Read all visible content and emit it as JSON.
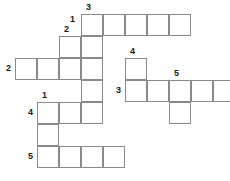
{
  "puzzle": {
    "title": "Crossword Grid",
    "type": "crossword-grid",
    "geometry": {
      "cell_size": 22,
      "origin_x": 15,
      "origin_y": 14,
      "border_color": "#8a8a8a",
      "cell_fill": "#ffffff",
      "background": "#ffffff",
      "number_color": "#1a1a1a"
    },
    "cells": [
      {
        "col": 3,
        "row": 0
      },
      {
        "col": 4,
        "row": 0
      },
      {
        "col": 5,
        "row": 0
      },
      {
        "col": 6,
        "row": 0
      },
      {
        "col": 7,
        "row": 0
      },
      {
        "col": 2,
        "row": 1
      },
      {
        "col": 3,
        "row": 1
      },
      {
        "col": 0,
        "row": 2
      },
      {
        "col": 1,
        "row": 2
      },
      {
        "col": 2,
        "row": 2
      },
      {
        "col": 3,
        "row": 2
      },
      {
        "col": 5,
        "row": 2
      },
      {
        "col": 3,
        "row": 3
      },
      {
        "col": 5,
        "row": 3
      },
      {
        "col": 6,
        "row": 3
      },
      {
        "col": 7,
        "row": 3
      },
      {
        "col": 8,
        "row": 3
      },
      {
        "col": 9,
        "row": 3
      },
      {
        "col": 1,
        "row": 4
      },
      {
        "col": 2,
        "row": 4
      },
      {
        "col": 3,
        "row": 4
      },
      {
        "col": 7,
        "row": 4
      },
      {
        "col": 1,
        "row": 5
      },
      {
        "col": 1,
        "row": 6
      },
      {
        "col": 2,
        "row": 6
      },
      {
        "col": 3,
        "row": 6
      },
      {
        "col": 4,
        "row": 6
      }
    ],
    "numbers": [
      {
        "label": "3",
        "col": 3,
        "row": 0,
        "pos": "above"
      },
      {
        "label": "1",
        "col": 3,
        "row": 0,
        "pos": "left-low"
      },
      {
        "label": "2",
        "col": 2,
        "row": 1,
        "pos": "above"
      },
      {
        "label": "2",
        "col": 0,
        "row": 2,
        "pos": "left"
      },
      {
        "label": "4",
        "col": 5,
        "row": 2,
        "pos": "above"
      },
      {
        "label": "3",
        "col": 5,
        "row": 3,
        "pos": "left"
      },
      {
        "label": "5",
        "col": 7,
        "row": 3,
        "pos": "above"
      },
      {
        "label": "1",
        "col": 1,
        "row": 4,
        "pos": "above"
      },
      {
        "label": "4",
        "col": 1,
        "row": 4,
        "pos": "left"
      },
      {
        "label": "5",
        "col": 1,
        "row": 6,
        "pos": "left"
      }
    ],
    "entries": {
      "across": [
        {
          "number": "3",
          "row": 0,
          "start_col": 3,
          "length": 5
        },
        {
          "number": "2",
          "row": 2,
          "start_col": 0,
          "length": 4
        },
        {
          "number": "3",
          "row": 3,
          "start_col": 5,
          "length": 5
        },
        {
          "number": "4",
          "row": 4,
          "start_col": 1,
          "length": 3
        },
        {
          "number": "5",
          "row": 6,
          "start_col": 1,
          "length": 4
        }
      ],
      "down": [
        {
          "number": "1",
          "col": 3,
          "start_row": 0,
          "length": 5
        },
        {
          "number": "2",
          "col": 2,
          "start_row": 1,
          "length": 2
        },
        {
          "number": "4",
          "col": 5,
          "start_row": 2,
          "length": 2
        },
        {
          "number": "5",
          "col": 7,
          "start_row": 3,
          "length": 2
        },
        {
          "number": "1",
          "col": 1,
          "start_row": 4,
          "length": 3
        }
      ]
    }
  }
}
